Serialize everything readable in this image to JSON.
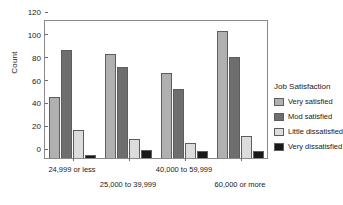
{
  "chart_data": {
    "type": "bar",
    "title": "",
    "xlabel": "",
    "ylabel": "Count",
    "ylim": [
      0,
      120
    ],
    "yticks": [
      0,
      20,
      40,
      60,
      80,
      100,
      120
    ],
    "grid": false,
    "legend_position": "right",
    "legend_title": "Job Satisfaction",
    "categories": [
      "24,999 or less",
      "25,000 to 39,999",
      "40,000 to 59,999",
      "60,000 or more"
    ],
    "series": [
      {
        "name": "Very satisfied",
        "color": "#b0b0b0",
        "values": [
          53,
          90,
          73,
          110
        ]
      },
      {
        "name": "Mod satisfied",
        "color": "#6e6e6e",
        "values": [
          93,
          79,
          60,
          87
        ]
      },
      {
        "name": "Little dissatisfied",
        "color": "#dcdcdc",
        "values": [
          24,
          16,
          13,
          19
        ]
      },
      {
        "name": "Very dissatisfied",
        "color": "#191919",
        "values": [
          3,
          7,
          6,
          6
        ]
      }
    ]
  },
  "axis": {
    "y_title": "Count",
    "y_ticks": [
      "0",
      "20",
      "40",
      "60",
      "80",
      "100",
      "120"
    ],
    "x_tick_labels": [
      "24,999 or less",
      "25,000 to 39,999",
      "40,000 to 59,999",
      "60,000 or more"
    ]
  },
  "legend": {
    "title": "Job Satisfaction",
    "items": [
      {
        "label": "Very satisfied",
        "color": "#b0b0b0"
      },
      {
        "label": "Mod satisfied",
        "color": "#6e6e6e"
      },
      {
        "label": "Little dissatisfied",
        "color": "#dcdcdc"
      },
      {
        "label": "Very dissatisfied",
        "color": "#191919"
      }
    ]
  }
}
